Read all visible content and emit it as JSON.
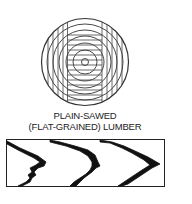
{
  "figure": {
    "title_line1": "PLAIN-SAWED",
    "title_line2": "(FLAT-GRAINED) LUMBER",
    "log_cross_section": {
      "description": "Log end view with concentric growth rings, cut into boards by parallel vertical saw lines; center block shows horizontal lines",
      "ring_count": 7
    },
    "board_face": {
      "description": "Face of plain-sawed board showing cathedral (V-shaped) grain pattern",
      "grain_arcs": 3
    },
    "colors": {
      "line": "#1a1a1a",
      "background": "#ffffff"
    }
  }
}
